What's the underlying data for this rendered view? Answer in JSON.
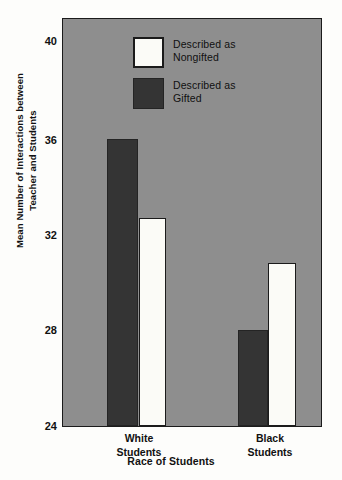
{
  "chart_data": {
    "type": "bar",
    "title": "",
    "xlabel": "Race of Students",
    "ylabel": "Mean Number of Interactions between Teacher and Students",
    "ylabel_line1": "Mean Number of Interactions between",
    "ylabel_line2": "Teacher and Students",
    "categories": [
      "White Students",
      "Black Students"
    ],
    "category_lines": [
      {
        "line1": "White",
        "line2": "Students"
      },
      {
        "line1": "Black",
        "line2": "Students"
      }
    ],
    "series": [
      {
        "name": "Described as Nongifted",
        "values": [
          32.7,
          30.8
        ]
      },
      {
        "name": "Described as Gifted",
        "values": [
          36.0,
          28.0
        ]
      }
    ],
    "legend": [
      {
        "label_line1": "Described as",
        "label_line2": "Nongifted",
        "swatch": "white"
      },
      {
        "label_line1": "Described as",
        "label_line2": "Gifted",
        "swatch": "dark"
      }
    ],
    "ylim": [
      24,
      41
    ],
    "yticks": [
      24,
      28,
      32,
      36,
      40
    ],
    "ytick_labels": [
      "24",
      "28",
      "32",
      "36",
      "40"
    ],
    "grid": false,
    "legend_position": "top-left-inside",
    "colors": {
      "plot_background": "#8e8e8e",
      "gifted_bar": "#343434",
      "nongifted_bar": "#fbfbf7",
      "axis": "#1b1b1b",
      "text": "#111111",
      "page_background": "#fdfdfb"
    }
  }
}
